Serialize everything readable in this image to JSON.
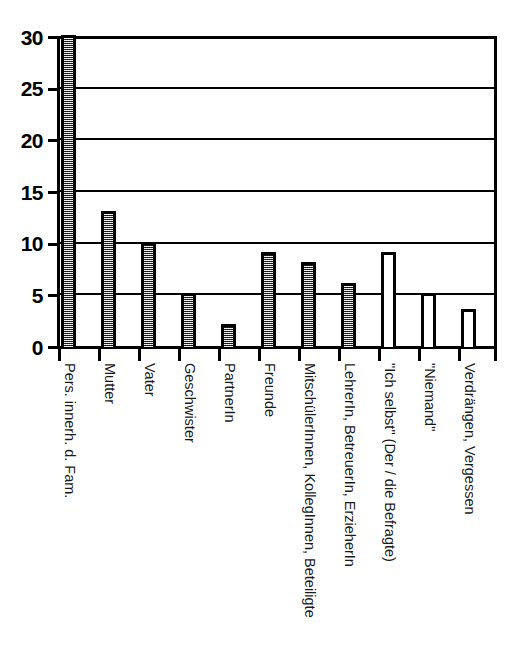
{
  "chart_data": {
    "type": "bar",
    "title": "",
    "subtitle": "",
    "xlabel": "",
    "ylabel": "",
    "ylim": [
      0,
      30
    ],
    "grid": true,
    "legend": "none",
    "y_ticks": [
      0,
      5,
      10,
      15,
      20,
      25,
      30
    ],
    "y_tick_labels": [
      "0",
      "5",
      "10",
      "15",
      "20",
      "25",
      "30"
    ],
    "categories": [
      "Pers. innerh. d. Fam.",
      "Mutter",
      "Vater",
      "Geschwister",
      "PartnerIn",
      "Freunde",
      "MitschülerInnen, KollegInnen, Beteiligte",
      "LehrerIn, BetreuerIn, ErzieherIn",
      "\"Ich selbst\" (Der / die Befragte)",
      "\"Niemand\"",
      "Verdrängen, Vergessen"
    ],
    "values": [
      30,
      13,
      10,
      5,
      2,
      9,
      8,
      6,
      9,
      5,
      3.5
    ],
    "fills": [
      "hatched",
      "hatched",
      "hatched",
      "hatched",
      "hatched",
      "hatched",
      "hatched",
      "hatched",
      "open",
      "open",
      "open"
    ],
    "colors": {
      "axis": "#000000",
      "grid": "#000000",
      "bar_edge": "#000000",
      "bar_fill_hatched": "#9a9a9a",
      "bar_fill_open": "#ffffff",
      "background": "#ffffff"
    }
  }
}
